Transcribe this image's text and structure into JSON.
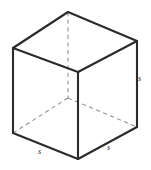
{
  "figure": {
    "name": "cube-edge-length-diagram",
    "type": "geometric-solid",
    "shape": "cube",
    "background_color": "#ffffff",
    "solid_edge_color": "#2b2b2b",
    "hidden_edge_color": "#8e8e8e",
    "label_color": "#2b2b2b",
    "vertices": {
      "top_back": [
        68,
        12
      ],
      "top_left": [
        13,
        48
      ],
      "top_right": [
        137,
        41
      ],
      "top_front": [
        78,
        72
      ],
      "bottom_left": [
        13,
        133
      ],
      "bottom_right": [
        137,
        127
      ],
      "bottom_front": [
        78,
        159
      ],
      "bottom_back_hidden": [
        68,
        98
      ]
    },
    "labels": {
      "right_edge": "s",
      "bottom_left_edge": "s",
      "bottom_right_edge": "s"
    }
  }
}
